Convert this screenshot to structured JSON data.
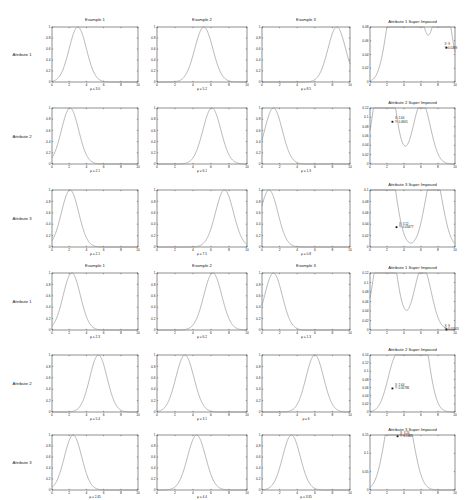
{
  "chart_data": {
    "type": "line",
    "layout": {
      "rows": 6,
      "cols": 4,
      "grid": false
    },
    "column_titles": [
      "Example 1",
      "Example 2",
      "Example 3"
    ],
    "row_labels": [
      "Attribute 1",
      "Attribute 2",
      "Attribute 3",
      "Attribute 1",
      "Attribute 2",
      "Attribute 3"
    ],
    "column_header_rows": [
      0,
      3
    ],
    "x_range": [
      0,
      10
    ],
    "x_ticks": [
      0,
      2,
      4,
      6,
      8,
      10
    ],
    "panels": [
      {
        "row": 0,
        "col": 0,
        "type": "gaussian",
        "mu": 3.0,
        "sigma": 1.0,
        "xlabel": "μ = 3.0",
        "ylim": [
          0,
          1
        ],
        "yticks": [
          0,
          0.2,
          0.4,
          0.6,
          0.8,
          1
        ]
      },
      {
        "row": 0,
        "col": 1,
        "type": "gaussian",
        "mu": 5.2,
        "sigma": 1.0,
        "xlabel": "μ = 5.2",
        "ylim": [
          0,
          1
        ],
        "yticks": [
          0,
          0.2,
          0.4,
          0.6,
          0.8,
          1
        ]
      },
      {
        "row": 0,
        "col": 2,
        "type": "gaussian",
        "mu": 8.5,
        "sigma": 1.0,
        "xlabel": "μ = 8.5",
        "ylim": [
          0,
          1
        ],
        "yticks": [
          0,
          0.2,
          0.4,
          0.6,
          0.8,
          1
        ]
      },
      {
        "row": 0,
        "col": 3,
        "type": "mixture",
        "title": "Attribute 1 Super Imposed",
        "components": [
          3.0,
          5.2,
          8.5
        ],
        "ylim": [
          0,
          0.08
        ],
        "yticks": [
          0,
          0.02,
          0.04,
          0.06,
          0.08
        ],
        "annotation": {
          "x": 9,
          "y": 0.0499,
          "label": [
            "X: 9",
            "Y: 0.0499"
          ]
        }
      },
      {
        "row": 1,
        "col": 0,
        "type": "gaussian",
        "mu": 2.1,
        "sigma": 1.0,
        "xlabel": "μ = 2.1",
        "ylim": [
          0,
          1
        ],
        "yticks": [
          0,
          0.2,
          0.4,
          0.6,
          0.8,
          1
        ]
      },
      {
        "row": 1,
        "col": 1,
        "type": "gaussian",
        "mu": 6.1,
        "sigma": 1.0,
        "xlabel": "μ = 6.1",
        "ylim": [
          0,
          1
        ],
        "yticks": [
          0,
          0.2,
          0.4,
          0.6,
          0.8,
          1
        ]
      },
      {
        "row": 1,
        "col": 2,
        "type": "gaussian",
        "mu": 1.3,
        "sigma": 1.0,
        "xlabel": "μ = 1.3",
        "ylim": [
          0,
          1
        ],
        "yticks": [
          0,
          0.2,
          0.4,
          0.6,
          0.8,
          1
        ]
      },
      {
        "row": 1,
        "col": 3,
        "type": "mixture",
        "title": "Attribute 2 Super Imposed",
        "components": [
          2.1,
          6.1,
          1.3
        ],
        "ylim": [
          0,
          0.12
        ],
        "yticks": [
          0,
          0.02,
          0.04,
          0.06,
          0.08,
          0.1,
          0.12
        ],
        "annotation": {
          "x": 2.64,
          "y": 0.0905,
          "label": [
            "X: 2.64",
            "Y: 0.0905"
          ]
        }
      },
      {
        "row": 2,
        "col": 0,
        "type": "gaussian",
        "mu": 2.1,
        "sigma": 1.0,
        "xlabel": "μ = 2.1",
        "ylim": [
          0,
          1
        ],
        "yticks": [
          0,
          0.2,
          0.4,
          0.6,
          0.8,
          1
        ]
      },
      {
        "row": 2,
        "col": 1,
        "type": "gaussian",
        "mu": 7.5,
        "sigma": 1.0,
        "xlabel": "μ = 7.5",
        "ylim": [
          0,
          1
        ],
        "yticks": [
          0,
          0.2,
          0.4,
          0.6,
          0.8,
          1
        ]
      },
      {
        "row": 2,
        "col": 2,
        "type": "gaussian",
        "mu": 0.8,
        "sigma": 1.0,
        "xlabel": "μ = 0.8",
        "ylim": [
          0,
          1
        ],
        "yticks": [
          0,
          0.2,
          0.4,
          0.6,
          0.8,
          1
        ]
      },
      {
        "row": 2,
        "col": 3,
        "type": "mixture",
        "title": "Attribute 3 Super Imposed",
        "components": [
          2.1,
          7.5,
          0.8
        ],
        "ylim": [
          0,
          0.1
        ],
        "yticks": [
          0,
          0.02,
          0.04,
          0.06,
          0.08,
          0.1
        ],
        "annotation": {
          "x": 3.12,
          "y": 0.03477,
          "label": [
            "X: 3.12",
            "Y: 0.03477"
          ]
        }
      },
      {
        "row": 3,
        "col": 0,
        "type": "gaussian",
        "mu": 2.3,
        "sigma": 1.0,
        "xlabel": "μ = 2.3",
        "ylim": [
          0,
          1
        ],
        "yticks": [
          0,
          0.2,
          0.4,
          0.6,
          0.8,
          1
        ]
      },
      {
        "row": 3,
        "col": 1,
        "type": "gaussian",
        "mu": 6.2,
        "sigma": 1.0,
        "xlabel": "μ = 6.2",
        "ylim": [
          0,
          1
        ],
        "yticks": [
          0,
          0.2,
          0.4,
          0.6,
          0.8,
          1
        ]
      },
      {
        "row": 3,
        "col": 2,
        "type": "gaussian",
        "mu": 1.3,
        "sigma": 1.0,
        "xlabel": "μ = 1.3",
        "ylim": [
          0,
          1
        ],
        "yticks": [
          0,
          0.2,
          0.4,
          0.6,
          0.8,
          1
        ]
      },
      {
        "row": 3,
        "col": 3,
        "type": "mixture",
        "title": "Attribute 1 Super Imposed",
        "components": [
          2.3,
          6.2,
          1.3
        ],
        "ylim": [
          0,
          0.12
        ],
        "yticks": [
          0,
          0.02,
          0.04,
          0.06,
          0.08,
          0.1,
          0.12
        ],
        "annotation": {
          "x": 9,
          "y": 0.00105,
          "label": [
            "X: 9",
            "Y: 0.00105"
          ]
        }
      },
      {
        "row": 4,
        "col": 0,
        "type": "gaussian",
        "mu": 5.4,
        "sigma": 1.0,
        "xlabel": "μ = 5.4",
        "ylim": [
          0,
          1
        ],
        "yticks": [
          0,
          0.2,
          0.4,
          0.6,
          0.8,
          1
        ]
      },
      {
        "row": 4,
        "col": 1,
        "type": "gaussian",
        "mu": 3.1,
        "sigma": 1.0,
        "xlabel": "μ = 3.1",
        "ylim": [
          0,
          1
        ],
        "yticks": [
          0,
          0.2,
          0.4,
          0.6,
          0.8,
          1
        ]
      },
      {
        "row": 4,
        "col": 2,
        "type": "gaussian",
        "mu": 6.0,
        "sigma": 1.0,
        "xlabel": "μ = 6",
        "ylim": [
          0,
          1
        ],
        "yticks": [
          0,
          0.2,
          0.4,
          0.6,
          0.8,
          1
        ]
      },
      {
        "row": 4,
        "col": 3,
        "type": "mixture",
        "title": "Attribute 2 Super Imposed",
        "components": [
          5.4,
          3.1,
          6.0
        ],
        "ylim": [
          0,
          0.14
        ],
        "yticks": [
          0,
          0.02,
          0.04,
          0.06,
          0.08,
          0.1,
          0.12,
          0.14
        ],
        "annotation": {
          "x": 2.64,
          "y": 0.05786,
          "label": [
            "X: 2.64",
            "Y: 0.05786"
          ]
        }
      },
      {
        "row": 5,
        "col": 0,
        "type": "gaussian",
        "mu": 2.45,
        "sigma": 1.0,
        "xlabel": "μ = 2.45",
        "ylim": [
          0,
          1
        ],
        "yticks": [
          0,
          0.2,
          0.4,
          0.6,
          0.8,
          1
        ]
      },
      {
        "row": 5,
        "col": 1,
        "type": "gaussian",
        "mu": 4.4,
        "sigma": 1.0,
        "xlabel": "μ = 4.4",
        "ylim": [
          0,
          1
        ],
        "yticks": [
          0,
          0.2,
          0.4,
          0.6,
          0.8,
          1
        ]
      },
      {
        "row": 5,
        "col": 2,
        "type": "gaussian",
        "mu": 3.35,
        "sigma": 1.0,
        "xlabel": "μ = 3.35",
        "ylim": [
          0,
          1
        ],
        "yticks": [
          0,
          0.2,
          0.4,
          0.6,
          0.8,
          1
        ]
      },
      {
        "row": 5,
        "col": 3,
        "type": "mixture",
        "title": "Attribute 3 Super Imposed",
        "components": [
          2.45,
          4.4,
          3.35
        ],
        "ylim": [
          0,
          0.15
        ],
        "yticks": [
          0,
          0.05,
          0.1,
          0.15
        ],
        "annotation": {
          "x": 3.24,
          "y": 0.1465,
          "label": [
            "X: 3.24",
            "Y: 0.1465"
          ]
        }
      }
    ]
  },
  "style": {
    "line_color": "#8a8a8a",
    "axis_color": "#222222",
    "marker_color": "#111111"
  }
}
